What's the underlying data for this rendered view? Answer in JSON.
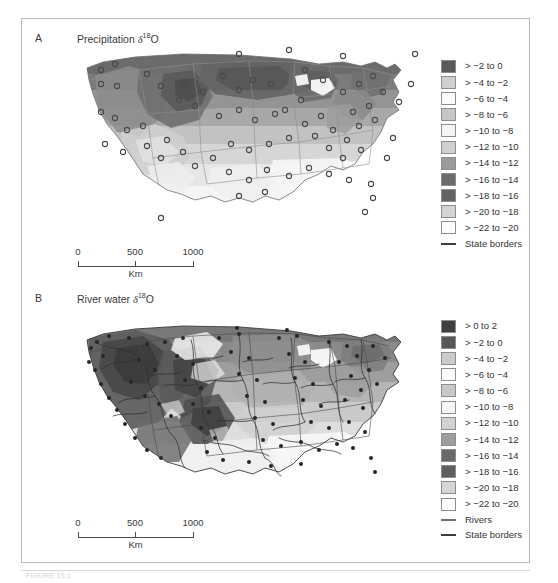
{
  "figure": {
    "caption_partial": "FIGURE 10.1",
    "frame": true
  },
  "panels": [
    {
      "id": "A",
      "letter": "A",
      "title_text": "Precipitation",
      "title_symbol": "δ",
      "title_superscript": "18",
      "title_element": "O",
      "scalebar": {
        "ticks": [
          "0",
          "500",
          "1000"
        ],
        "unit": "Km"
      },
      "legend": {
        "entries": [
          {
            "label": "> −2 to 0",
            "color": "#5a5a5a"
          },
          {
            "label": "> −4 to −2",
            "color": "#d0d0d0"
          },
          {
            "label": "> −6 to −4",
            "color": "#fbfbfb"
          },
          {
            "label": "> −8 to −6",
            "color": "#c6c6c6"
          },
          {
            "label": "> −10 to −8",
            "color": "#f4f4f4"
          },
          {
            "label": "> −12 to −10",
            "color": "#cfcfcf"
          },
          {
            "label": "> −14 to −12",
            "color": "#9a9a9a"
          },
          {
            "label": "> −16 to −14",
            "color": "#6b6b6b"
          },
          {
            "label": "> −18 to −16",
            "color": "#636363"
          },
          {
            "label": "> −20 to −18",
            "color": "#d4d4d4"
          },
          {
            "label": "> −22 to −20",
            "color": "#ffffff"
          }
        ],
        "lines": [
          {
            "label": "State borders",
            "kind": "border",
            "color": "#8a8a8a"
          }
        ]
      }
    },
    {
      "id": "B",
      "letter": "B",
      "title_text": "River water",
      "title_symbol": "δ",
      "title_superscript": "18",
      "title_element": "O",
      "scalebar": {
        "ticks": [
          "0",
          "500",
          "1000"
        ],
        "unit": "Km"
      },
      "legend": {
        "entries": [
          {
            "label": "> 0 to 2",
            "color": "#3f3f3f"
          },
          {
            "label": "> −2 to 0",
            "color": "#585858"
          },
          {
            "label": "> −4 to −2",
            "color": "#cbcbcb"
          },
          {
            "label": "> −6 to −4",
            "color": "#fcfcfc"
          },
          {
            "label": "> −8 to −6",
            "color": "#c8c8c8"
          },
          {
            "label": "> −10 to −8",
            "color": "#f6f6f6"
          },
          {
            "label": "> −12 to −10",
            "color": "#d2d2d2"
          },
          {
            "label": "> −14 to −12",
            "color": "#9d9d9d"
          },
          {
            "label": "> −16 to −14",
            "color": "#6a6a6a"
          },
          {
            "label": "> −18 to −16",
            "color": "#5f5f5f"
          },
          {
            "label": "> −20 to −18",
            "color": "#d6d6d6"
          },
          {
            "label": "> −22 to −20",
            "color": "#ffffff"
          }
        ],
        "lines": [
          {
            "label": "Rivers",
            "kind": "river",
            "color": "#6f6f6f"
          },
          {
            "label": "State borders",
            "kind": "border",
            "color": "#3c3c3c"
          }
        ]
      }
    }
  ],
  "map": {
    "type": "choropleth-isotope-map",
    "region": "Contiguous United States",
    "panel_a_markers_note": "station circles",
    "panel_b_markers_note": "sample dots"
  }
}
